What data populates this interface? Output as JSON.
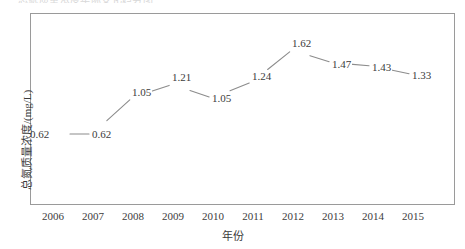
{
  "clipped_title": "总氮质量浓度年际变化趋势图",
  "chart_data": {
    "type": "line",
    "title": "",
    "xlabel": "年份",
    "ylabel": "总氮质量浓度/(mg/L)",
    "categories": [
      "2006",
      "2007",
      "2008",
      "2009",
      "2010",
      "2011",
      "2012",
      "2013",
      "2014",
      "2015"
    ],
    "values": [
      0.62,
      0.62,
      1.05,
      1.21,
      1.05,
      1.24,
      1.62,
      1.47,
      1.43,
      1.33
    ],
    "point_labels": [
      "0.62",
      "0.62",
      "1.05",
      "1.21",
      "1.05",
      "1.24",
      "1.62",
      "1.47",
      "1.43",
      "1.33"
    ],
    "ylim": [
      0.4,
      1.78
    ],
    "xlim": [
      "2006",
      "2015"
    ],
    "grid": false,
    "legend": null,
    "y_ticks_visible": false,
    "series": [
      {
        "name": "总氮质量浓度",
        "values": [
          0.62,
          0.62,
          1.05,
          1.21,
          1.05,
          1.24,
          1.62,
          1.47,
          1.43,
          1.33
        ],
        "color": "#8c8c8c"
      }
    ],
    "colors": {
      "line": "#8c8c8c",
      "frame": "#9a9a9a",
      "text": "#3c3c3c",
      "background": "#ffffff"
    }
  }
}
